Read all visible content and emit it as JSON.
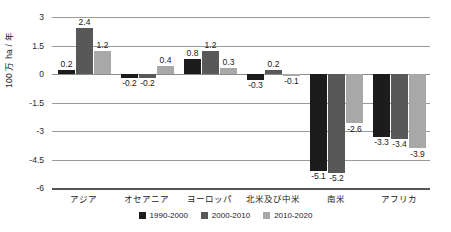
{
  "chart_data": {
    "type": "bar",
    "title": "",
    "xlabel": "",
    "ylabel": "100 万 ha / 年",
    "ylim": [
      -6,
      3
    ],
    "yticks": [
      3,
      1.5,
      0,
      -1.5,
      -3,
      -4.5,
      -6
    ],
    "ytick_labels": [
      "3",
      "1.5",
      "0",
      "-1.5",
      "-3",
      "-4.5",
      "-6"
    ],
    "grid": true,
    "legend_position": "bottom",
    "categories": [
      "アジア",
      "オセアニア",
      "ヨーロッパ",
      "北米及び中米",
      "南米",
      "アフリカ"
    ],
    "series": [
      {
        "name": "1990-2000",
        "color": "#1c1c1c",
        "values": [
          0.2,
          -0.2,
          0.8,
          -0.3,
          -5.1,
          -3.3
        ],
        "labels": [
          "0.2",
          "-0.2",
          "0.8",
          "-0.3",
          "-5.1",
          "-3.3"
        ]
      },
      {
        "name": "2000-2010",
        "color": "#585858",
        "values": [
          2.4,
          -0.2,
          1.2,
          0.2,
          -5.2,
          -3.4
        ],
        "labels": [
          "2.4",
          "-0.2",
          "1.2",
          "0.2",
          "-5.2",
          "-3.4"
        ]
      },
      {
        "name": "2010-2020",
        "color": "#a8a8a8",
        "values": [
          1.2,
          0.4,
          0.3,
          -0.1,
          -2.6,
          -3.9
        ],
        "labels": [
          "1.2",
          "0.4",
          "0.3",
          "-0.1",
          "-2.6",
          "-3.9"
        ]
      }
    ]
  },
  "legend": {
    "items": [
      {
        "label": "1990-2000",
        "color": "#1c1c1c"
      },
      {
        "label": "2000-2010",
        "color": "#585858"
      },
      {
        "label": "2010-2020",
        "color": "#a8a8a8"
      }
    ]
  }
}
